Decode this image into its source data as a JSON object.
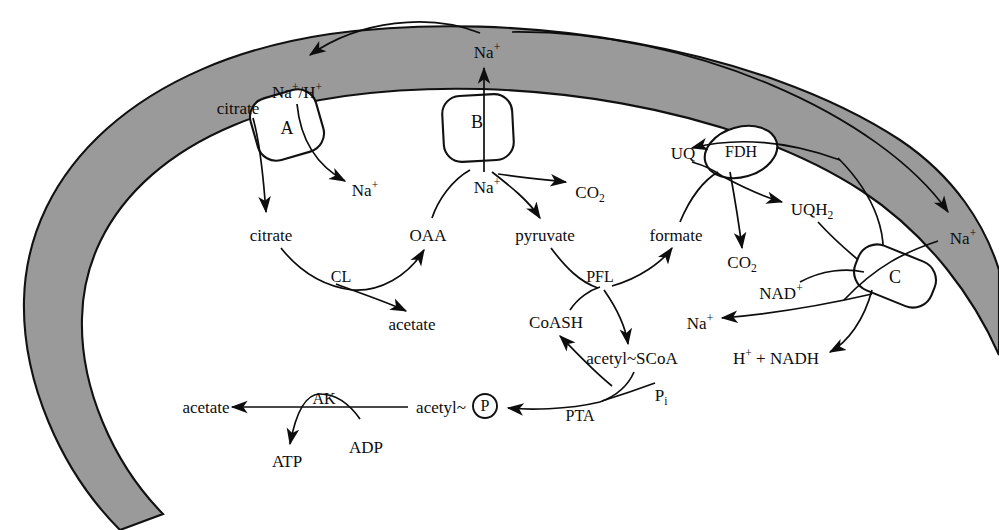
{
  "figure": {
    "type": "biochemical-pathway-diagram",
    "membrane": {
      "shape": "thick open arc ring (C-shaped cell envelope)",
      "fill_color": "#9a9a9a",
      "stroke_color": "#111111"
    },
    "background_color": "#ffffff",
    "ink_color": "#0d0d0d"
  },
  "transporters": [
    {
      "id": "A",
      "label": "A",
      "role": "citrate / Na+ carrier",
      "x": 287,
      "y": 125
    },
    {
      "id": "B",
      "label": "B",
      "role": "Na+ exporter",
      "x": 477,
      "y": 122
    },
    {
      "id": "C",
      "label": "C",
      "role": "Na+ translocating NADH dehydrogenase",
      "x": 895,
      "y": 277
    }
  ],
  "enzymes": [
    {
      "id": "FDH",
      "label": "FDH",
      "name": "formate dehydrogenase",
      "x": 741,
      "y": 152
    },
    {
      "id": "CL",
      "label": "CL",
      "name": "citrate lyase",
      "x": 341,
      "y": 277
    },
    {
      "id": "PFL",
      "label": "PFL",
      "name": "pyruvate formate-lyase",
      "x": 600,
      "y": 277
    },
    {
      "id": "PTA",
      "label": "PTA",
      "name": "phosphotransacetylase",
      "x": 580,
      "y": 416
    },
    {
      "id": "AK",
      "label": "AK",
      "name": "acetate kinase",
      "x": 324,
      "y": 399
    }
  ],
  "metabolites": [
    {
      "id": "na-top",
      "text": "Na+",
      "html": "Na<sup>+</sup>",
      "x": 487,
      "y": 52,
      "compartment": "outside"
    },
    {
      "id": "na-h-antiport",
      "text": "Na+/H+",
      "html": "Na<sup>+</sup>/H<sup>+</sup>",
      "x": 297,
      "y": 92,
      "compartment": "outside"
    },
    {
      "id": "citrate-out",
      "text": "citrate",
      "html": "citrate",
      "x": 238,
      "y": 108,
      "compartment": "outside"
    },
    {
      "id": "na-left-in",
      "text": "Na+",
      "html": "Na<sup>+</sup>",
      "x": 365,
      "y": 190,
      "compartment": "inside"
    },
    {
      "id": "citrate-in",
      "text": "citrate",
      "html": "citrate",
      "x": 271,
      "y": 235,
      "compartment": "inside"
    },
    {
      "id": "oaa",
      "text": "OAA",
      "html": "OAA",
      "x": 428,
      "y": 235,
      "compartment": "inside"
    },
    {
      "id": "acetate-cl",
      "text": "acetate",
      "html": "acetate",
      "x": 412,
      "y": 324,
      "compartment": "inside"
    },
    {
      "id": "na-b-in",
      "text": "Na+",
      "html": "Na<sup>+</sup>",
      "x": 487,
      "y": 187,
      "compartment": "inside"
    },
    {
      "id": "pyruvate",
      "text": "pyruvate",
      "html": "pyruvate",
      "x": 545,
      "y": 235,
      "compartment": "inside"
    },
    {
      "id": "co2-pyruvate",
      "text": "CO2",
      "html": "CO<sub>2</sub>",
      "x": 590,
      "y": 192,
      "compartment": "inside"
    },
    {
      "id": "formate",
      "text": "formate",
      "html": "formate",
      "x": 676,
      "y": 235,
      "compartment": "inside"
    },
    {
      "id": "coash",
      "text": "CoASH",
      "html": "CoASH",
      "x": 556,
      "y": 322,
      "compartment": "inside"
    },
    {
      "id": "acetyl-scoa",
      "text": "acetyl~SCoA",
      "html": "acetyl~SCoA",
      "x": 632,
      "y": 358,
      "compartment": "inside"
    },
    {
      "id": "pi",
      "text": "Pi",
      "html": "P<sub>i</sub>",
      "x": 661,
      "y": 395,
      "compartment": "inside"
    },
    {
      "id": "acetyl-p",
      "text": "acetyl~P",
      "html": "acetyl~",
      "x": 441,
      "y": 407,
      "compartment": "inside"
    },
    {
      "id": "acetate-ak",
      "text": "acetate",
      "html": "acetate",
      "x": 206,
      "y": 407,
      "compartment": "inside"
    },
    {
      "id": "atp",
      "text": "ATP",
      "html": "ATP",
      "x": 287,
      "y": 461,
      "compartment": "inside"
    },
    {
      "id": "adp",
      "text": "ADP",
      "html": "ADP",
      "x": 366,
      "y": 447,
      "compartment": "inside"
    },
    {
      "id": "uq",
      "text": "UQ",
      "html": "UQ",
      "x": 683,
      "y": 153,
      "compartment": "membrane"
    },
    {
      "id": "uqh2",
      "text": "UQH2",
      "html": "UQH<sub>2</sub>",
      "x": 812,
      "y": 209,
      "compartment": "membrane"
    },
    {
      "id": "co2-fdh",
      "text": "CO2",
      "html": "CO<sub>2</sub>",
      "x": 742,
      "y": 262,
      "compartment": "inside"
    },
    {
      "id": "nad-plus",
      "text": "NAD+",
      "html": "NAD<sup>+</sup>",
      "x": 781,
      "y": 293,
      "compartment": "inside"
    },
    {
      "id": "na-c-out",
      "text": "Na+",
      "html": "Na<sup>+</sup>",
      "x": 963,
      "y": 238,
      "compartment": "outside"
    },
    {
      "id": "na-c-in",
      "text": "Na+",
      "html": "Na<sup>+</sup>",
      "x": 700,
      "y": 323,
      "compartment": "inside"
    },
    {
      "id": "h-nadh",
      "text": "H+ + NADH",
      "html": "H<sup>+</sup> + NADH",
      "x": 776,
      "y": 358,
      "compartment": "inside"
    }
  ],
  "reaction_arrows": [
    {
      "from": "citrate (out)",
      "to": "transporter A",
      "kind": "uptake"
    },
    {
      "from": "transporter A",
      "to": "citrate (in)",
      "kind": "uptake"
    },
    {
      "from": "Na+/H+ (out)",
      "to": "Na+ (in)",
      "kind": "antiport"
    },
    {
      "from": "transporter B",
      "to": "Na+ (out)",
      "kind": "export"
    },
    {
      "from": "citrate (in)",
      "to": "OAA + acetate",
      "kind": "enzymatic",
      "enzyme": "CL"
    },
    {
      "from": "OAA",
      "to": "transporter B",
      "kind": "decarboxylation-driven"
    },
    {
      "from": "Na+ (in)",
      "to": "pyruvate + CO2",
      "kind": "enzymatic"
    },
    {
      "from": "pyruvate + CoASH",
      "to": "formate + acetyl~SCoA",
      "kind": "enzymatic",
      "enzyme": "PFL"
    },
    {
      "from": "formate",
      "to": "CO2 + UQH2",
      "kind": "enzymatic",
      "enzyme": "FDH"
    },
    {
      "from": "UQ",
      "to": "UQH2",
      "kind": "redox"
    },
    {
      "from": "UQH2 + NAD+",
      "to": "H+ + NADH",
      "kind": "enzymatic",
      "transporter": "C"
    },
    {
      "from": "transporter C",
      "to": "Na+ (in) and Na+ (out)",
      "kind": "Na+ translocation"
    },
    {
      "from": "acetyl~SCoA + Pi",
      "to": "acetyl~P + CoASH",
      "kind": "enzymatic",
      "enzyme": "PTA"
    },
    {
      "from": "acetyl~P + ADP",
      "to": "acetate + ATP",
      "kind": "enzymatic",
      "enzyme": "AK"
    },
    {
      "from": "Na+ (out, top)",
      "to": "Na+/H+ antiporter A",
      "kind": "circulation"
    },
    {
      "from": "Na+ (out, top)",
      "to": "Na+ (out, right)",
      "kind": "circulation"
    }
  ],
  "circle_labels": [
    {
      "id": "phosphate-circle",
      "text": "P",
      "x": 485,
      "y": 406,
      "r": 12
    }
  ]
}
